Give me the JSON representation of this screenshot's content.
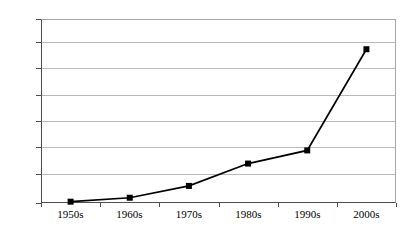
{
  "chart_data": {
    "type": "line",
    "title": "",
    "subtitle": "",
    "xlabel": "",
    "ylabel": "",
    "categories": [
      "1950s",
      "1960s",
      "1970s",
      "1980s",
      "1990s",
      "2000s"
    ],
    "values": [
      1,
      4,
      13,
      30,
      40,
      117
    ],
    "series": [
      {
        "name": "",
        "values": [
          1,
          4,
          13,
          30,
          40,
          117
        ],
        "marker": "square",
        "marker_color": "#000000",
        "line_color": "#000000"
      }
    ],
    "ylim": [
      0,
      140
    ],
    "yticks": [
      0,
      20,
      40,
      60,
      80,
      100,
      120,
      140
    ],
    "ytick_labels": [
      "0",
      "20",
      "40",
      "60",
      "80",
      "100",
      "120",
      "140"
    ],
    "xtick_labels": [
      "1950s",
      "1960s",
      "1970s",
      "1980s",
      "1990s",
      "2000s"
    ],
    "grid": true,
    "grid_axis": "y",
    "grid_color": "#b9b9b9",
    "legend": false,
    "legend_position": "none",
    "plot_background": "#ffffff",
    "axis_color": "#4d4d4d",
    "annotations": []
  }
}
